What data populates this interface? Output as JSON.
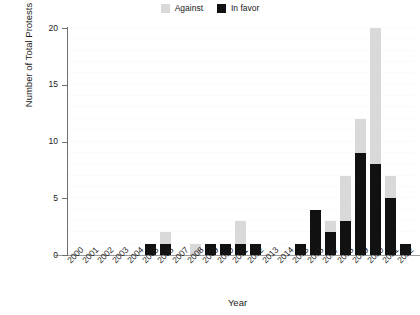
{
  "chart_data": {
    "type": "bar",
    "stacked": true,
    "title": "",
    "subtitle": "",
    "xlabel": "Year",
    "ylabel": "Number of Total Protests",
    "categories": [
      "2000",
      "2001",
      "2002",
      "2003",
      "2004",
      "2005",
      "2006",
      "2007",
      "2008",
      "2009",
      "2010",
      "2011",
      "2012",
      "2013",
      "2014",
      "2015",
      "2016",
      "2017",
      "2018",
      "2019",
      "2020",
      "2021",
      "2022"
    ],
    "series": [
      {
        "name": "In favor",
        "color": "#111111",
        "values": [
          0,
          0,
          0,
          0,
          0,
          1,
          1,
          0,
          0,
          1,
          1,
          1,
          1,
          0,
          0,
          1,
          4,
          2,
          3,
          9,
          8,
          5,
          1
        ]
      },
      {
        "name": "Against",
        "color": "#d9d9d9",
        "values": [
          0,
          0,
          0,
          0,
          0,
          0,
          1,
          0,
          1,
          0,
          0,
          2,
          0,
          0,
          0,
          0,
          0,
          1,
          4,
          3,
          12,
          2,
          0
        ]
      }
    ],
    "totals": [
      0,
      0,
      0,
      0,
      0,
      1,
      2,
      0,
      1,
      1,
      1,
      3,
      1,
      0,
      0,
      1,
      4,
      3,
      7,
      12,
      20,
      7,
      1
    ],
    "ylim": [
      0,
      20
    ],
    "yticks": [
      0,
      5,
      10,
      15,
      20
    ],
    "ytick_labels": [
      "0",
      "5",
      "10",
      "15",
      "20"
    ],
    "grid": true,
    "grid_axis": "y",
    "legend_position": "top-center"
  },
  "legend": {
    "entries": [
      {
        "label": "Against",
        "color": "#d9d9d9"
      },
      {
        "label": "In favor",
        "color": "#111111"
      }
    ]
  },
  "axes": {
    "x_title": "Year",
    "y_title": "Number of Total Protests"
  },
  "colors": {
    "favor": "#111111",
    "against": "#d9d9d9",
    "axis": "#6e6e6e",
    "grid": "#fafafa",
    "background": "#ffffff"
  }
}
